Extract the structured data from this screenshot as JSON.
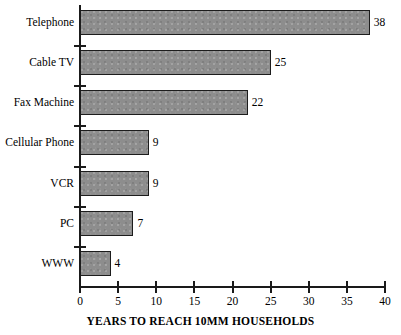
{
  "chart_data": {
    "type": "bar",
    "orientation": "horizontal",
    "title": "",
    "xlabel": "YEARS TO REACH 10MM HOUSEHOLDS",
    "ylabel": "",
    "categories": [
      "Telephone",
      "Cable TV",
      "Fax Machine",
      "Cellular Phone",
      "VCR",
      "PC",
      "WWW"
    ],
    "values": [
      38,
      25,
      22,
      9,
      9,
      7,
      4
    ],
    "value_labels": [
      "38",
      "25",
      "22",
      "9",
      "9",
      "7",
      "4"
    ],
    "xlim": [
      0,
      40
    ],
    "xticks": [
      0,
      5,
      10,
      15,
      20,
      25,
      30,
      35,
      40
    ],
    "xtick_labels": [
      "0",
      "5",
      "10",
      "15",
      "20",
      "25",
      "30",
      "35",
      "40"
    ],
    "grid": false,
    "legend": false,
    "bar_color": "#8d8d8d",
    "bar_edge_color": "#1c1c1c",
    "axis_color": "#1a1a1a",
    "background_color": "#ffffff"
  }
}
